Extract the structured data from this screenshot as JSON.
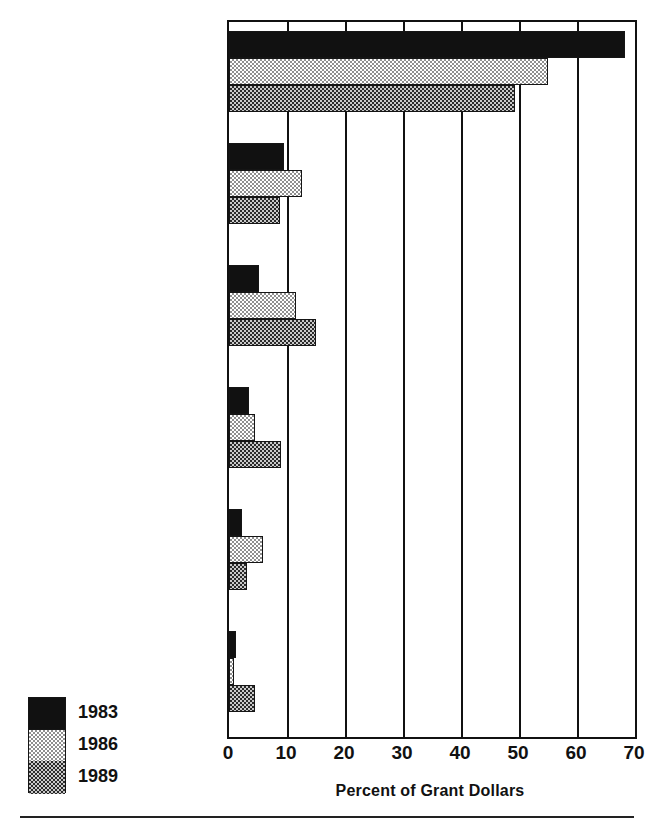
{
  "chart_data": {
    "type": "bar",
    "orientation": "horizontal",
    "title": "",
    "subtitle": "",
    "xlabel": "Percent of Grant Dollars",
    "ylabel": "",
    "xlim": [
      0,
      70
    ],
    "xticks": [
      0,
      10,
      20,
      30,
      40,
      50,
      60,
      70
    ],
    "xtick_labels": [
      "0",
      "10",
      "20",
      "30",
      "40",
      "50",
      "60",
      "70"
    ],
    "grid": "vertical gridlines at every x tick",
    "legend_position": "bottom-left, outside plot area",
    "categories": [
      "Art Museums",
      "Natural History Museums",
      "History Museums",
      "Science/Technology Museums",
      "Children's Museums",
      "Ethnic/Folk Museums"
    ],
    "category_label_lines": [
      [
        "Art Museums"
      ],
      [
        "Natural History",
        "Museums"
      ],
      [
        "History Museums"
      ],
      [
        "Science/Technology",
        "Museums"
      ],
      [
        "Children's Museums"
      ],
      [
        "Ethnic/Folk Museums"
      ]
    ],
    "series": [
      {
        "name": "1983",
        "fill": "solid-black",
        "color": "#111111",
        "values": [
          68.3,
          9.4,
          5.2,
          3.4,
          2.2,
          1.2
        ]
      },
      {
        "name": "1986",
        "fill": "light-checker",
        "color": "#d9d9d9",
        "values": [
          55.0,
          12.6,
          11.6,
          4.4,
          5.8,
          0.8
        ]
      },
      {
        "name": "1989",
        "fill": "dark-checker",
        "color": "#6e6e6e",
        "values": [
          49.3,
          8.8,
          15.0,
          8.9,
          3.0,
          4.5
        ]
      }
    ]
  },
  "legend": {
    "entries": [
      {
        "label": "1983",
        "swatch": "solid-black-swatch"
      },
      {
        "label": "1986",
        "swatch": "light-checker-swatch"
      },
      {
        "label": "1989",
        "swatch": "dark-checker-swatch"
      }
    ]
  },
  "axis": {
    "x_title": "Percent of Grant Dollars",
    "ticks": [
      "0",
      "10",
      "20",
      "30",
      "40",
      "50",
      "60",
      "70"
    ]
  }
}
